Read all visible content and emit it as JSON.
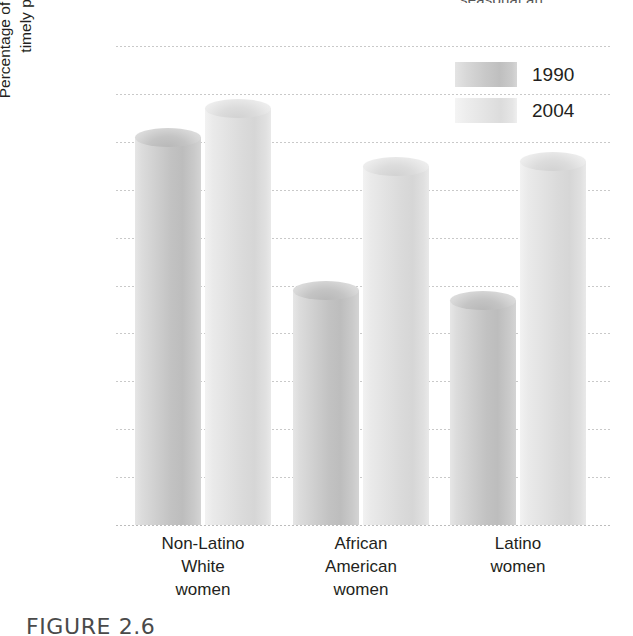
{
  "figure": {
    "top_cut_text": "seasonal an",
    "caption": "FIGURE 2.6"
  },
  "axis": {
    "y_title_line1": "Percentage of U.S. women using",
    "y_title_line2": "timely prenatal care",
    "y_ticks": [
      "100",
      "90",
      "80",
      "70",
      "60",
      "50",
      "40",
      "30",
      "20",
      "10",
      "0"
    ]
  },
  "legend": {
    "items": [
      {
        "label": "1990",
        "series_key": "y1990",
        "color": "#c4c4c4"
      },
      {
        "label": "2004",
        "series_key": "y2004",
        "color": "#e2e2e2"
      }
    ]
  },
  "categories": [
    {
      "line1": "Non-Latino",
      "line2": "White",
      "line3": "women"
    },
    {
      "line1": "African",
      "line2": "American",
      "line3": "women"
    },
    {
      "line1": "Latino",
      "line2": "women",
      "line3": ""
    }
  ],
  "chart_data": {
    "type": "bar",
    "title": "",
    "xlabel": "",
    "ylabel": "Percentage of U.S. women using timely prenatal care",
    "ylim": [
      0,
      100
    ],
    "ytick_step": 10,
    "grid": true,
    "legend_position": "top-right",
    "categories": [
      "Non-Latino White women",
      "African American women",
      "Latino women"
    ],
    "series": [
      {
        "name": "1990",
        "values": [
          81,
          49,
          47
        ],
        "color": "#c4c4c4"
      },
      {
        "name": "2004",
        "values": [
          87,
          75,
          76
        ],
        "color": "#e2e2e2"
      }
    ]
  }
}
